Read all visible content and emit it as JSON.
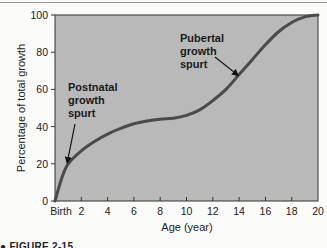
{
  "chart_data": {
    "type": "line",
    "title": "",
    "xlabel": "Age (year)",
    "ylabel": "Percentage of total growth",
    "xlim": [
      0,
      20
    ],
    "ylim": [
      0,
      100
    ],
    "grid": false,
    "legend": null,
    "x_ticks": [
      0,
      2,
      4,
      6,
      8,
      10,
      12,
      14,
      16,
      18,
      20
    ],
    "x_tick_labels": [
      "Birth",
      "2",
      "4",
      "6",
      "8",
      "10",
      "12",
      "14",
      "16",
      "18",
      "20"
    ],
    "y_ticks": [
      0,
      20,
      40,
      60,
      80,
      100
    ],
    "y_tick_labels": [
      "0",
      "20",
      "40",
      "60",
      "80",
      "100"
    ],
    "series": [
      {
        "name": "Growth curve",
        "x": [
          0,
          0.5,
          1,
          2,
          3,
          4,
          5,
          6,
          7,
          8,
          9,
          10,
          11,
          12,
          13,
          14,
          15,
          16,
          17,
          18,
          19,
          20
        ],
        "y": [
          0,
          12,
          20,
          27,
          32,
          36,
          39,
          41.5,
          43,
          44,
          44.5,
          46,
          49,
          54,
          60,
          68,
          76,
          84,
          91,
          96,
          99,
          100
        ]
      }
    ],
    "annotations": [
      {
        "text_lines": [
          "Postnatal",
          "growth",
          "spurt"
        ],
        "arrow_to": {
          "x": 1,
          "y": 20
        }
      },
      {
        "text_lines": [
          "Pubertal",
          "growth",
          "spurt"
        ],
        "arrow_to": {
          "x": 14,
          "y": 67
        }
      }
    ],
    "colors": {
      "plot_background": "#b9b9b9",
      "line": "#4a4a4a",
      "axis": "#333333"
    }
  },
  "caption": "● FIGURE 2-15"
}
